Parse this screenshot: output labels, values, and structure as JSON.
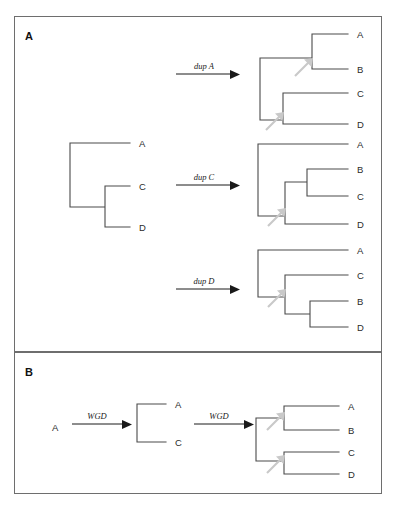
{
  "figure": {
    "background_color": "#ffffff",
    "line_color": "#4a4a4a",
    "border_color": "#6e6e6e",
    "marker_color": "#c9c9c9",
    "text_color": "#2b2b2b"
  },
  "panels": [
    {
      "id": "panel-a",
      "label": "A",
      "box": {
        "x": 14,
        "y": 16,
        "w": 367,
        "h": 335
      },
      "source_tree": {
        "name": "species-tree",
        "leaves": [
          "A",
          "C",
          "D"
        ]
      },
      "transitions": [
        {
          "id": "dup-a",
          "label": "dup A",
          "result_leaves": [
            "A",
            "B",
            "C",
            "D"
          ],
          "duplication_nodes": 2
        },
        {
          "id": "dup-c",
          "label": "dup C",
          "result_leaves": [
            "A",
            "B",
            "C",
            "D"
          ],
          "duplication_nodes": 1
        },
        {
          "id": "dup-d",
          "label": "dup D",
          "result_leaves": [
            "A",
            "C",
            "B",
            "D"
          ],
          "duplication_nodes": 1
        }
      ]
    },
    {
      "id": "panel-b",
      "label": "B",
      "box": {
        "x": 14,
        "y": 352,
        "w": 367,
        "h": 142
      },
      "start_label": "A",
      "transitions": [
        {
          "id": "wgd-1",
          "label": "WGD",
          "result_leaves": [
            "A",
            "C"
          ],
          "duplication_nodes": 0
        },
        {
          "id": "wgd-2",
          "label": "WGD",
          "result_leaves": [
            "A",
            "B",
            "C",
            "D"
          ],
          "duplication_nodes": 2
        }
      ]
    }
  ],
  "trees": {
    "source_a": {
      "name": "source-tree-acd",
      "leaf_labels": [
        "A",
        "C",
        "D"
      ],
      "leaf_label_x": 139,
      "leaf_y": [
        143,
        186,
        227
      ],
      "tip_x": 130,
      "root_x": 70,
      "nodes": [
        {
          "x": 70,
          "y_top": 143,
          "y_bot": 207
        },
        {
          "x": 105,
          "y_top": 186,
          "y_bot": 227
        }
      ]
    },
    "dup_a": {
      "name": "tree-dup-a",
      "leaf_labels": [
        "A",
        "B",
        "C",
        "D"
      ],
      "leaf_label_x": 357,
      "leaf_y": [
        34,
        69,
        93,
        124
      ],
      "tip_x": 348,
      "root_x": 260,
      "dup_markers": [
        {
          "x": 305,
          "y": 65
        },
        {
          "x": 275,
          "y": 120
        }
      ]
    },
    "dup_c": {
      "name": "tree-dup-c",
      "leaf_labels": [
        "A",
        "B",
        "C",
        "D"
      ],
      "leaf_label_x": 357,
      "leaf_y": [
        144,
        169,
        196,
        224
      ],
      "tip_x": 348,
      "root_x": 258,
      "dup_markers": [
        {
          "x": 277,
          "y": 216
        }
      ]
    },
    "dup_d": {
      "name": "tree-dup-d",
      "leaf_labels": [
        "A",
        "C",
        "B",
        "D"
      ],
      "leaf_label_x": 357,
      "leaf_y": [
        250,
        275,
        301,
        327
      ],
      "tip_x": 348,
      "root_x": 258,
      "dup_markers": [
        {
          "x": 277,
          "y": 297
        }
      ]
    },
    "wgd_1": {
      "name": "tree-wgd-ac",
      "leaf_labels": [
        "A",
        "C"
      ],
      "leaf_label_x": 175,
      "leaf_y": [
        404,
        442
      ],
      "tip_x": 166,
      "root_x": 137
    },
    "wgd_2": {
      "name": "tree-wgd-abcd",
      "leaf_labels": [
        "A",
        "B",
        "C",
        "D"
      ],
      "leaf_label_x": 348,
      "leaf_y": [
        406,
        430,
        452,
        474
      ],
      "tip_x": 339,
      "root_x": 256,
      "dup_markers": [
        {
          "x": 275,
          "y": 425
        },
        {
          "x": 275,
          "y": 468
        }
      ]
    }
  },
  "arrows": {
    "dup_a": {
      "x1": 176,
      "x2": 232,
      "y": 74,
      "label": "dup A",
      "label_x": 204,
      "label_y": 68
    },
    "dup_c": {
      "x1": 176,
      "x2": 232,
      "y": 185,
      "label": "dup C",
      "label_x": 204,
      "label_y": 179
    },
    "dup_d": {
      "x1": 176,
      "x2": 232,
      "y": 289,
      "label": "dup D",
      "label_x": 204,
      "label_y": 283
    },
    "wgd_1": {
      "x1": 72,
      "x2": 124,
      "y": 424,
      "label": "WGD",
      "label_x": 98,
      "label_y": 418
    },
    "wgd_2": {
      "x1": 194,
      "x2": 246,
      "y": 424,
      "label": "WGD",
      "label_x": 220,
      "label_y": 418
    }
  },
  "panel_b_start": {
    "label": "A",
    "x": 52,
    "y": 428
  }
}
